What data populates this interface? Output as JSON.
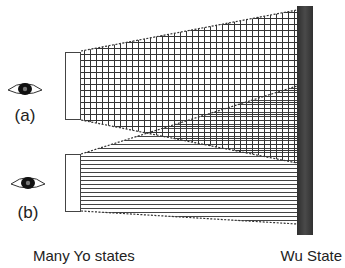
{
  "diagram": {
    "observers": [
      {
        "id": "a",
        "label": "(a)",
        "icon": "eye-icon"
      },
      {
        "id": "b",
        "label": "(b)",
        "icon": "eye-icon"
      }
    ],
    "regions": [
      {
        "id": "a",
        "pattern": "grid-hatch",
        "description": "beam from source (a) to Wu State"
      },
      {
        "id": "b",
        "pattern": "horizontal-hatch",
        "description": "beam from source (b) to Wu State"
      }
    ],
    "left_caption": "Many Yo states",
    "right_caption": "Wu State",
    "colors": {
      "bar": "#3a3a3a",
      "lines": "#333333",
      "background": "#ffffff"
    }
  }
}
